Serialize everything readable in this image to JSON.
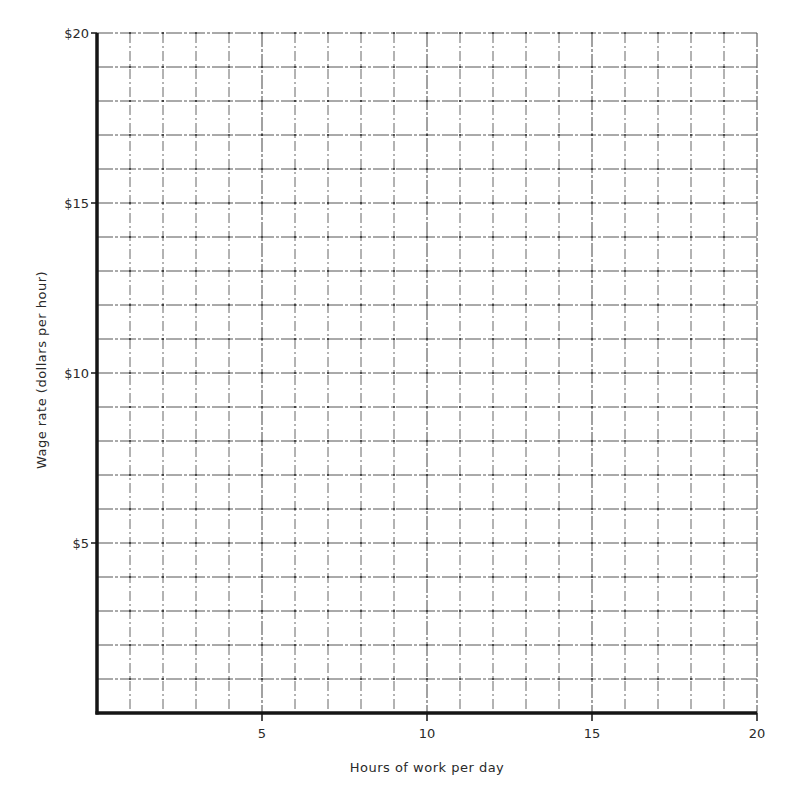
{
  "chart_data": {
    "type": "line",
    "title": "",
    "xlabel": "Hours of work per day",
    "ylabel": "Wage rate (dollars per hour)",
    "xlim": [
      0,
      20
    ],
    "ylim": [
      0,
      20
    ],
    "x_ticks": [
      {
        "value": 5,
        "label": "5"
      },
      {
        "value": 10,
        "label": "10"
      },
      {
        "value": 15,
        "label": "15"
      },
      {
        "value": 20,
        "label": "20"
      }
    ],
    "y_ticks": [
      {
        "value": 5,
        "label": "$5"
      },
      {
        "value": 10,
        "label": "$10"
      },
      {
        "value": 15,
        "label": "$15"
      },
      {
        "value": 20,
        "label": "$20"
      }
    ],
    "grid": true,
    "grid_step_x": 1,
    "grid_step_y": 1,
    "series": [],
    "legend": null,
    "note": "Blank graph grid worksheet; no data plotted"
  },
  "colors": {
    "axis": "#151515",
    "grid": "#555555",
    "background": "#ffffff"
  }
}
